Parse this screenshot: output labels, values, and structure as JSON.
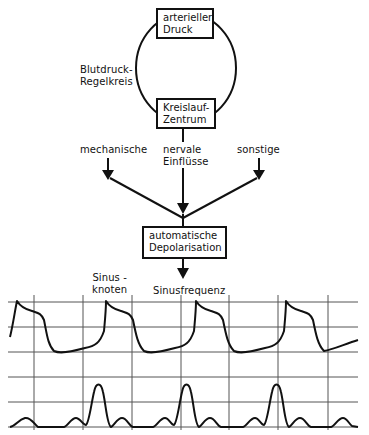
{
  "diagram": {
    "boxes": {
      "arterial_pressure": [
        "arterieller",
        "Druck"
      ],
      "circulation_center": [
        "Kreislauf-",
        "Zentrum"
      ],
      "automatic_depolarisation": [
        "automatische",
        "Depolarisation"
      ]
    },
    "loop_label": [
      "Blutdruck-",
      "Regelkreis"
    ],
    "influences": {
      "mechanical": "mechanische",
      "neural": [
        "nervale",
        "Einflüsse"
      ],
      "other": "sonstige"
    },
    "sinus_node_label": [
      "Sinus -",
      "knoten"
    ],
    "output_label": "Sinusfrequenz"
  },
  "traces": {
    "upper": "action-potential",
    "lower": "pulse-waveform",
    "grid_color": "#555555",
    "trace_color": "#111111"
  }
}
